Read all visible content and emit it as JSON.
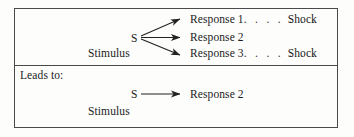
{
  "figure": {
    "panels": [
      {
        "id": "conflict-panel",
        "stimulus_symbol": "S",
        "stimulus_label": "Stimulus",
        "responses": [
          {
            "label": "Response 1",
            "leader": ". . . . . . .",
            "outcome": "Shock"
          },
          {
            "label": "Response 2",
            "leader": "",
            "outcome": ""
          },
          {
            "label": "Response 3",
            "leader": ". . . . . . .",
            "outcome": "Shock"
          }
        ]
      },
      {
        "id": "resolution-panel",
        "caption": "Leads to:",
        "stimulus_symbol": "S",
        "stimulus_label": "Stimulus",
        "responses": [
          {
            "label": "Response 2",
            "leader": "",
            "outcome": ""
          }
        ]
      }
    ],
    "colors": {
      "ink": "#1b1b1b",
      "rule": "#4a4a4a",
      "paper": "#fdfdfb"
    }
  }
}
